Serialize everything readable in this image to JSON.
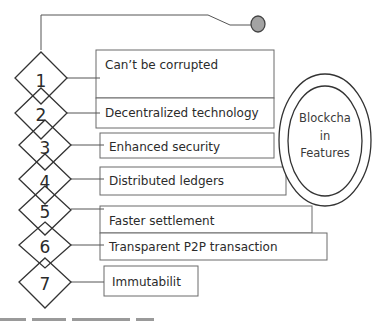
{
  "diagram": {
    "type": "numbered-features-list",
    "colors": {
      "stroke": "#3c3c3c",
      "terminal_fill": "#a3a3a3",
      "text": "#2b2b2b",
      "background": "#ffffff"
    },
    "center": {
      "line1": "Blockcha",
      "line2": "in",
      "line3": "Features"
    },
    "items": [
      {
        "number": "1",
        "label": "Can’t be corrupted"
      },
      {
        "number": "2",
        "label": "Decentralized technology"
      },
      {
        "number": "3",
        "label": "Enhanced security"
      },
      {
        "number": "4",
        "label": "Distributed ledgers"
      },
      {
        "number": "5",
        "label": "Faster settlement"
      },
      {
        "number": "6",
        "label": "Transparent P2P transaction"
      },
      {
        "number": "7",
        "label": "Immutabilit"
      }
    ]
  }
}
